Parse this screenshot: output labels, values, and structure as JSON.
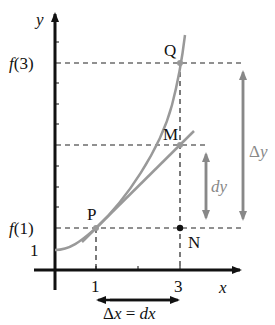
{
  "diagram": {
    "axes": {
      "x_label": "x",
      "y_label": "y",
      "x_ticks": [
        "1",
        "3"
      ],
      "y_ticks": [
        "1",
        "f(1)",
        "f(3)"
      ]
    },
    "points": {
      "P": "P",
      "Q": "Q",
      "M": "M",
      "N": "N"
    },
    "annotations": {
      "dy": "dy",
      "delta_y": "Δy",
      "delta_x": "Δx = dx"
    },
    "colors": {
      "curve": "#999999",
      "axes": "#111111",
      "arrows_gray": "#888888",
      "dashed": "#222222"
    }
  }
}
